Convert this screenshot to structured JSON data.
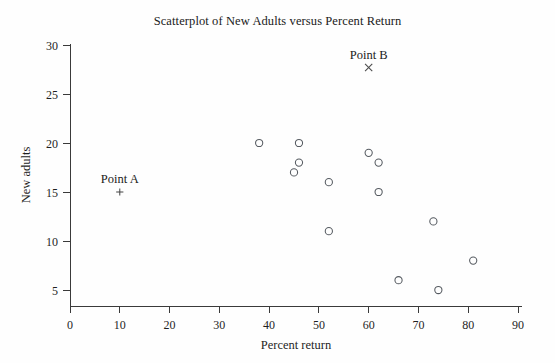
{
  "chart_data": {
    "type": "scatter",
    "title": "Scatterplot of New Adults versus Percent Return",
    "xlabel": "Percent return",
    "ylabel": "New adults",
    "xlim": [
      0,
      90
    ],
    "ylim": [
      3.5,
      31
    ],
    "xticks": [
      0,
      10,
      20,
      30,
      40,
      50,
      60,
      70,
      80,
      90
    ],
    "yticks": [
      5,
      10,
      15,
      20,
      25,
      30
    ],
    "grid": false,
    "legend": "none",
    "series": [
      {
        "name": "Colonies",
        "marker": "open-circle",
        "points": [
          {
            "x": 38,
            "y": 20
          },
          {
            "x": 46,
            "y": 20
          },
          {
            "x": 46,
            "y": 18
          },
          {
            "x": 45,
            "y": 17
          },
          {
            "x": 52,
            "y": 16
          },
          {
            "x": 52,
            "y": 11
          },
          {
            "x": 60,
            "y": 19
          },
          {
            "x": 62,
            "y": 18
          },
          {
            "x": 62,
            "y": 15
          },
          {
            "x": 73,
            "y": 12
          },
          {
            "x": 81,
            "y": 8
          },
          {
            "x": 66,
            "y": 6
          },
          {
            "x": 74,
            "y": 5
          }
        ]
      }
    ],
    "annotations": [
      {
        "label": "Point A",
        "marker": "plus",
        "x": 10,
        "y": 15
      },
      {
        "label": "Point B",
        "marker": "cross",
        "x": 60,
        "y": 27.7
      }
    ],
    "colors": {
      "background": "#fefefe",
      "axis": "#3a3a3a",
      "marker": "#555a60",
      "text": "#1a1a1a"
    }
  }
}
